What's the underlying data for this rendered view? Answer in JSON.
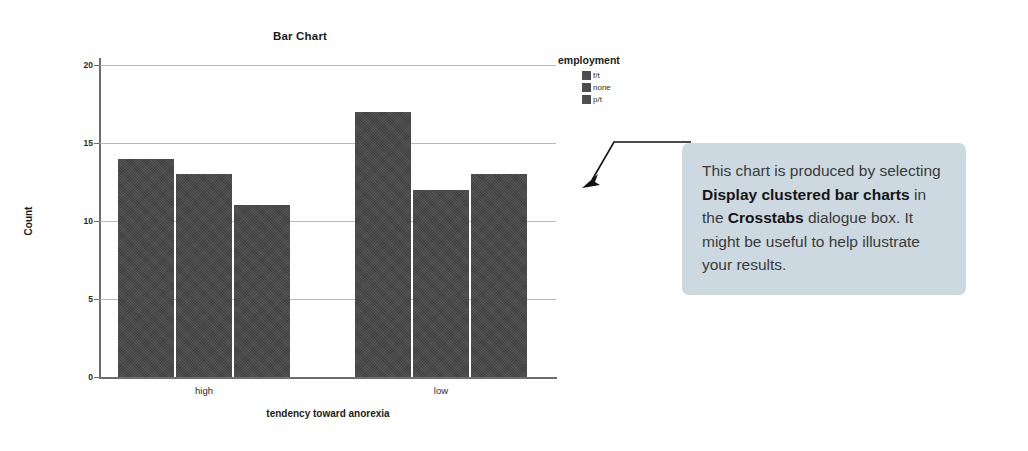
{
  "chart_data": {
    "type": "bar",
    "title": "Bar Chart",
    "xlabel": "tendency toward anorexia",
    "ylabel": "Count",
    "categories": [
      "high",
      "low"
    ],
    "series": [
      {
        "name": "f/t",
        "values": [
          14,
          17
        ]
      },
      {
        "name": "none",
        "values": [
          13,
          12
        ]
      },
      {
        "name": "p/t",
        "values": [
          11,
          13
        ]
      }
    ],
    "legend_title": "employment",
    "legend_position": "right",
    "ylim": [
      0,
      20
    ],
    "yticks": [
      0,
      5,
      10,
      15,
      20
    ],
    "ytick_labels": [
      "0",
      "5",
      "10",
      "15",
      "20"
    ],
    "grid": true,
    "bar_color": "#454545"
  },
  "callout": {
    "text_segments": [
      {
        "text": "This chart is produced by selecting ",
        "bold": false
      },
      {
        "text": "Display clustered bar charts",
        "bold": true
      },
      {
        "text": " in the ",
        "bold": false
      },
      {
        "text": "Crosstabs",
        "bold": true
      },
      {
        "text": " dialogue box. It might be useful to help illustrate your results.",
        "bold": false
      }
    ],
    "background_color": "#ccd9e0",
    "pointer": "arrow-down-left"
  }
}
